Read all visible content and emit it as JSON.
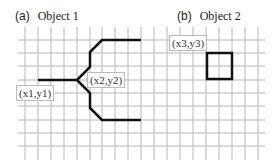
{
  "panels": [
    {
      "letter": "(a)",
      "title": "Object 1"
    },
    {
      "letter": "(b)",
      "title": "Object 2"
    }
  ],
  "labels": {
    "p1": "(x1,y1)",
    "p2": "(x2,y2)",
    "p3": "(x3,y3)"
  },
  "colors": {
    "grid": "#b8b8b8",
    "stroke": "#111111"
  }
}
